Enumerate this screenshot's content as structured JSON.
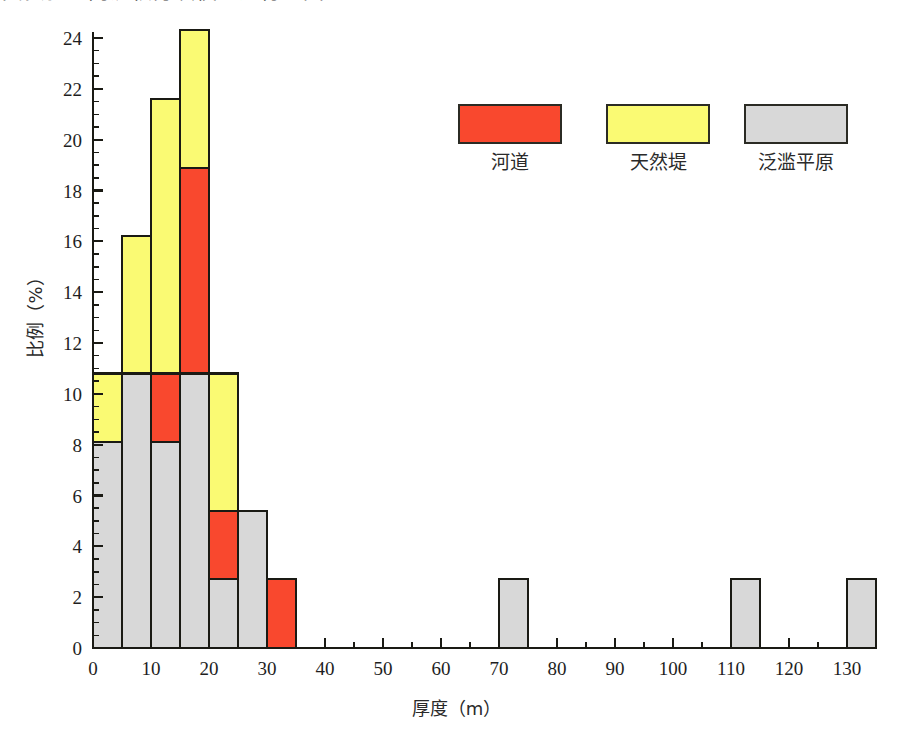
{
  "caption": {
    "text": "其实验区内沉积分块模型进行（图 6-32）。"
  },
  "chart_data": {
    "type": "bar",
    "subtype": "stacked-histogram",
    "title": "",
    "xlabel": "厚度（m）",
    "ylabel": "比例（%）",
    "xlim": [
      0,
      135
    ],
    "ylim": [
      0,
      25.2
    ],
    "xticks": [
      0,
      10,
      20,
      30,
      40,
      50,
      60,
      70,
      80,
      90,
      100,
      110,
      120,
      130
    ],
    "yticks": [
      0,
      2,
      4,
      6,
      8,
      10,
      12,
      14,
      16,
      18,
      20,
      22,
      24
    ],
    "xtick_labels": [
      "0",
      "10",
      "20",
      "30",
      "40",
      "50",
      "60",
      "70",
      "80",
      "90",
      "100",
      "110",
      "120",
      "130"
    ],
    "ytick_labels": [
      "0",
      "2",
      "4",
      "6",
      "8",
      "10",
      "12",
      "14",
      "16",
      "18",
      "20",
      "22",
      "24"
    ],
    "minor_tick_step_y": 0.5,
    "minor_tick_step_x": 5,
    "grid": false,
    "legend_position": "upper-right-inside",
    "bin_width": 5,
    "stack_order_bottom_to_top": [
      "floodplain",
      "channel",
      "levee"
    ],
    "series": [
      {
        "key": "channel",
        "name": "河道",
        "color": "#F9482E",
        "bins": [
          0,
          5,
          10,
          15,
          20,
          25,
          30,
          70,
          110,
          130
        ],
        "values": [
          0,
          0,
          2.7,
          8.1,
          2.7,
          0,
          2.7,
          0,
          0,
          0
        ]
      },
      {
        "key": "levee",
        "name": "天然堤",
        "color": "#FAFA73",
        "bins": [
          0,
          5,
          10,
          15,
          20,
          25,
          30,
          70,
          110,
          130
        ],
        "values": [
          2.7,
          5.4,
          10.8,
          5.4,
          5.4,
          0,
          0,
          0,
          0,
          0
        ]
      },
      {
        "key": "floodplain",
        "name": "泛滥平原",
        "color": "#D8D8D8",
        "bins": [
          0,
          5,
          10,
          15,
          20,
          25,
          30,
          70,
          110,
          130
        ],
        "values": [
          8.1,
          10.8,
          8.1,
          10.8,
          2.7,
          5.4,
          0,
          2.7,
          2.7,
          2.7
        ]
      }
    ],
    "bin_totals": [
      10.8,
      16.2,
      21.6,
      24.3,
      10.8,
      5.4,
      2.7,
      2.7,
      2.7,
      2.7
    ]
  },
  "legend": {
    "entries": [
      {
        "label": "河道",
        "color": "#F9482E"
      },
      {
        "label": "天然堤",
        "color": "#FAFA73"
      },
      {
        "label": "泛滥平原",
        "color": "#D8D8D8"
      }
    ]
  },
  "axes": {
    "x_title": "厚度（m）",
    "y_title": "比例（%）"
  }
}
